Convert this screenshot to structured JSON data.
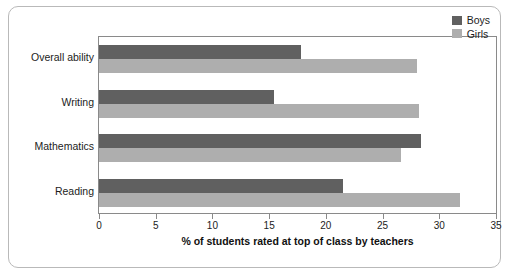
{
  "chart_data": {
    "type": "bar",
    "orientation": "horizontal",
    "title": "",
    "xlabel": "% of students rated at top of class by teachers",
    "ylabel": "",
    "categories": [
      "Overall ability",
      "Writing",
      "Mathematics",
      "Reading"
    ],
    "series": [
      {
        "name": "Boys",
        "color": "#606060",
        "values": [
          17.8,
          15.4,
          28.4,
          21.5
        ]
      },
      {
        "name": "Girls",
        "color": "#aeaeae",
        "values": [
          28.0,
          28.2,
          26.6,
          31.8
        ]
      }
    ],
    "xlim": [
      0,
      35
    ],
    "xticks": [
      0,
      5,
      10,
      15,
      20,
      25,
      30,
      35
    ],
    "xtick_labels": [
      "0",
      "5",
      "10",
      "15",
      "20",
      "25",
      "30",
      "35"
    ],
    "grid": false,
    "legend_position": "top-right",
    "legend_entries": [
      "Boys",
      "Girls"
    ]
  }
}
